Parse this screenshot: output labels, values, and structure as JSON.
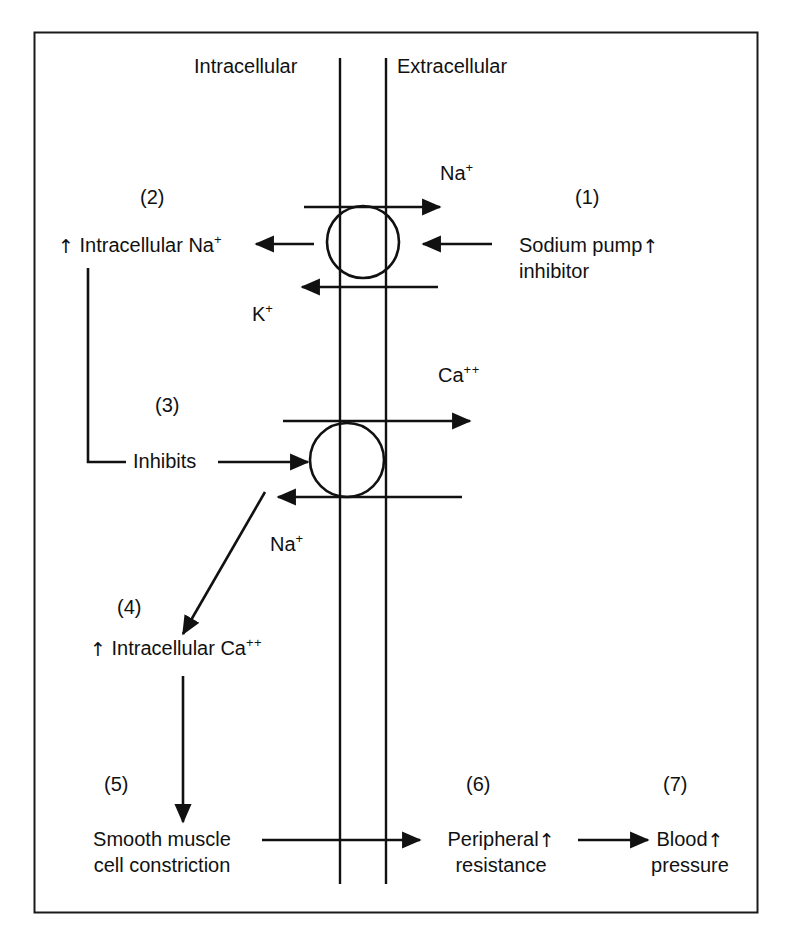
{
  "figure": {
    "border_color": "#1a1a1a",
    "ink_color": "#111111",
    "background": "#ffffff"
  },
  "compartments": {
    "left_label": "Intracellular",
    "right_label": "Extracellular"
  },
  "steps": [
    {
      "number": "(1)",
      "line1": "Sodium pump",
      "line2": "inhibitor",
      "arrow_glyph": "↑"
    },
    {
      "number": "(2)",
      "text": "Intracellular Na",
      "superscript": "+",
      "arrow_glyph": "↑"
    },
    {
      "number": "(3)",
      "text": "Inhibits"
    },
    {
      "number": "(4)",
      "text": "Intracellular Ca",
      "superscript": "++",
      "arrow_glyph": "↑"
    },
    {
      "number": "(5)",
      "line1": "Smooth muscle",
      "line2": "cell constriction"
    },
    {
      "number": "(6)",
      "line1": "Peripheral",
      "line2": "resistance",
      "arrow_glyph": "↑"
    },
    {
      "number": "(7)",
      "line1": "Blood",
      "line2": "pressure",
      "arrow_glyph": "↑"
    }
  ],
  "ions": [
    {
      "name": "sodium-efflux",
      "symbol": "Na",
      "superscript": "+"
    },
    {
      "name": "potassium-influx",
      "symbol": "K",
      "superscript": "+"
    },
    {
      "name": "calcium-efflux",
      "symbol": "Ca",
      "superscript": "++"
    },
    {
      "name": "sodium-influx",
      "symbol": "Na",
      "superscript": "+"
    }
  ],
  "transporters": [
    {
      "name": "sodium-potassium-pump",
      "shape": "circle"
    },
    {
      "name": "sodium-calcium-exchanger",
      "shape": "circle"
    }
  ]
}
